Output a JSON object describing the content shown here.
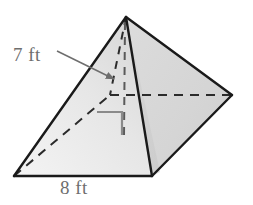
{
  "figure": {
    "kind": "square-pyramid-diagram",
    "labels": {
      "slant_height": "7 ft",
      "base_edge": "8 ft"
    },
    "annotations": {
      "right_angle_marker": "right-angle",
      "leader_arrow": "arrow pointing to slant height edge"
    },
    "colors": {
      "edge_visible": "#1a1a1a",
      "edge_hidden": "#2b2b2b",
      "face_left_light": "#efefef",
      "face_left_dark": "#d9d9d9",
      "face_right": "#d6d6d6",
      "face_front_small": "#cfcfcf",
      "label_text": "#6e6e6e",
      "marker": "#8a8a8a",
      "background": "#ffffff"
    },
    "geometry": {
      "apex": [
        126,
        17
      ],
      "vertex_left": [
        14,
        176
      ],
      "vertex_front": [
        152,
        176
      ],
      "vertex_right": [
        232,
        95
      ],
      "vertex_back_hidden": [
        110,
        95
      ]
    },
    "measurements": {
      "slant_height_value": 7,
      "slant_height_unit": "ft",
      "base_edge_value": 8,
      "base_edge_unit": "ft"
    }
  }
}
